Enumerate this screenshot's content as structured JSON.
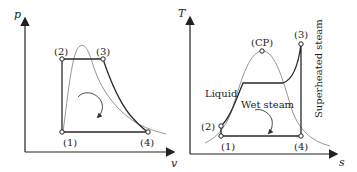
{
  "figure": {
    "left_diagram": {
      "title": "p-v diagram",
      "y_axis_label": "p",
      "x_axis_label": "v",
      "points": [
        {
          "label": "(1)",
          "x": 62,
          "y": 132
        },
        {
          "label": "(2)",
          "x": 62,
          "y": 59
        },
        {
          "label": "(3)",
          "x": 103,
          "y": 59
        },
        {
          "label": "(4)",
          "x": 148,
          "y": 132
        }
      ]
    },
    "right_diagram": {
      "title": "T-s diagram",
      "y_axis_label": "T",
      "x_axis_label": "s",
      "critical_point_label": "(CP)",
      "region_labels": {
        "liquid": "Liquid",
        "wet_steam": "Wet steam",
        "superheated_steam": "Superheated steam"
      },
      "points": [
        {
          "label": "(1)",
          "x": 221,
          "y": 136
        },
        {
          "label": "(2)",
          "x": 221,
          "y": 126
        },
        {
          "label": "(3)",
          "x": 301,
          "y": 44
        },
        {
          "label": "(4)",
          "x": 301,
          "y": 136
        }
      ]
    },
    "colors": {
      "cycle_line": "#2a2a2a",
      "dome_line": "#8a8a8a",
      "axis": "#222222"
    }
  }
}
